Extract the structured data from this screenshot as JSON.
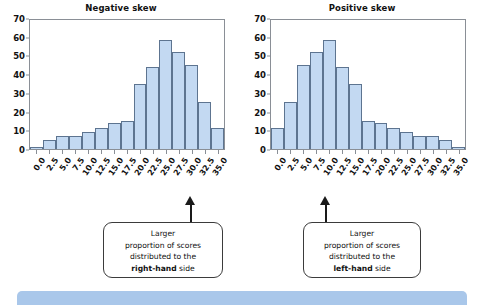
{
  "chart_data": [
    {
      "type": "bar",
      "title": "Negative skew",
      "xlabel": "",
      "ylabel": "",
      "ylim": [
        0,
        70
      ],
      "yticks": [
        0,
        10,
        20,
        30,
        40,
        50,
        60,
        70
      ],
      "categories": [
        "0.0",
        "2.5",
        "5.0",
        "7.5",
        "10.0",
        "12.5",
        "15.0",
        "17.5",
        "20.0",
        "22.5",
        "25.0",
        "27.5",
        "30.0",
        "32.5",
        "35.0"
      ],
      "values": [
        1,
        5,
        7,
        7,
        9,
        11,
        14,
        15,
        35,
        44,
        58,
        52,
        45,
        25,
        11
      ],
      "grid": false,
      "legend": "none",
      "bar_fill": "#c3d9f2",
      "bar_stroke": "#5d7490",
      "annotation": "Larger proportion of scores distributed to the right-hand side"
    },
    {
      "type": "bar",
      "title": "Positive skew",
      "xlabel": "",
      "ylabel": "",
      "ylim": [
        0,
        70
      ],
      "yticks": [
        0,
        10,
        20,
        30,
        40,
        50,
        60,
        70
      ],
      "categories": [
        "0.0",
        "2.5",
        "5.0",
        "7.5",
        "10.0",
        "12.5",
        "15.0",
        "17.5",
        "20.0",
        "22.5",
        "25.0",
        "27.5",
        "30.0",
        "32.5",
        "35.0"
      ],
      "values": [
        11,
        25,
        45,
        52,
        58,
        44,
        35,
        15,
        14,
        11,
        9,
        7,
        7,
        5,
        1
      ],
      "grid": false,
      "legend": "none",
      "bar_fill": "#c3d9f2",
      "bar_stroke": "#5d7490",
      "annotation": "Larger proportion of scores distributed to the left-hand side"
    }
  ],
  "panels": [
    {
      "title": "Negative skew",
      "callout": {
        "line1": "Larger",
        "line2": "proportion of scores",
        "line3": "distributed to the",
        "line4_bold": "right-hand",
        "line4_rest": " side"
      }
    },
    {
      "title": "Positive skew",
      "callout": {
        "line1": "Larger",
        "line2": "proportion of scores",
        "line3": "distributed to the",
        "line4_bold": "left-hand",
        "line4_rest": " side"
      }
    }
  ],
  "colors": {
    "bar_fill": "#c3d9f2",
    "bar_stroke": "#5d7490",
    "axis": "#8a8f96",
    "band": "#a9c7ea",
    "text": "#111111"
  }
}
